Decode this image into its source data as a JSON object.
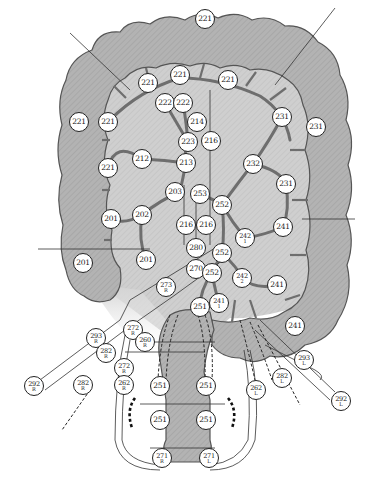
{
  "diagram": {
    "colors": {
      "colon_fill": "#b5b5b5",
      "colon_stroke": "#555555",
      "mesentery_fill": "#d6d6d6",
      "vessel": "#6e6e6e",
      "node_fill": "#ffffff",
      "node_stroke": "#222222",
      "line": "#333333"
    },
    "nodes": [
      {
        "id": "n1",
        "label": "221",
        "sub": "",
        "x": 205,
        "y": 19
      },
      {
        "id": "n2",
        "label": "221",
        "sub": "",
        "x": 148,
        "y": 83
      },
      {
        "id": "n3",
        "label": "221",
        "sub": "",
        "x": 180,
        "y": 75
      },
      {
        "id": "n4",
        "label": "221",
        "sub": "",
        "x": 228,
        "y": 80
      },
      {
        "id": "n5",
        "label": "222",
        "sub": "",
        "x": 165,
        "y": 103
      },
      {
        "id": "n6",
        "label": "222",
        "sub": "",
        "x": 183,
        "y": 103
      },
      {
        "id": "n7",
        "label": "214",
        "sub": "",
        "x": 197,
        "y": 122
      },
      {
        "id": "n8",
        "label": "216",
        "sub": "",
        "x": 211,
        "y": 141
      },
      {
        "id": "n9",
        "label": "223",
        "sub": "",
        "x": 188,
        "y": 142
      },
      {
        "id": "n10",
        "label": "221",
        "sub": "",
        "x": 79,
        "y": 122
      },
      {
        "id": "n11",
        "label": "221",
        "sub": "",
        "x": 108,
        "y": 122
      },
      {
        "id": "n12",
        "label": "231",
        "sub": "",
        "x": 282,
        "y": 117
      },
      {
        "id": "n13",
        "label": "231",
        "sub": "",
        "x": 316,
        "y": 127
      },
      {
        "id": "n14",
        "label": "212",
        "sub": "",
        "x": 142,
        "y": 159
      },
      {
        "id": "n15",
        "label": "213",
        "sub": "",
        "x": 186,
        "y": 163
      },
      {
        "id": "n16",
        "label": "232",
        "sub": "",
        "x": 253,
        "y": 164
      },
      {
        "id": "n17",
        "label": "221",
        "sub": "",
        "x": 108,
        "y": 168
      },
      {
        "id": "n18",
        "label": "231",
        "sub": "",
        "x": 286,
        "y": 184
      },
      {
        "id": "n19",
        "label": "203",
        "sub": "",
        "x": 175,
        "y": 192
      },
      {
        "id": "n20",
        "label": "253",
        "sub": "",
        "x": 200,
        "y": 194
      },
      {
        "id": "n21",
        "label": "252",
        "sub": "",
        "x": 222,
        "y": 205
      },
      {
        "id": "n22",
        "label": "201",
        "sub": "",
        "x": 111,
        "y": 219
      },
      {
        "id": "n23",
        "label": "202",
        "sub": "",
        "x": 142,
        "y": 215
      },
      {
        "id": "n24",
        "label": "216",
        "sub": "",
        "x": 186,
        "y": 225
      },
      {
        "id": "n25",
        "label": "216",
        "sub": "",
        "x": 206,
        "y": 225
      },
      {
        "id": "n26",
        "label": "241",
        "sub": "",
        "x": 283,
        "y": 227
      },
      {
        "id": "n27",
        "label": "242",
        "sub": "1",
        "x": 245,
        "y": 238
      },
      {
        "id": "n28",
        "label": "280",
        "sub": "",
        "x": 196,
        "y": 248
      },
      {
        "id": "n29",
        "label": "252",
        "sub": "",
        "x": 222,
        "y": 253
      },
      {
        "id": "n30",
        "label": "201",
        "sub": "",
        "x": 83,
        "y": 263
      },
      {
        "id": "n31",
        "label": "201",
        "sub": "",
        "x": 146,
        "y": 260
      },
      {
        "id": "n32",
        "label": "270",
        "sub": "",
        "x": 196,
        "y": 269
      },
      {
        "id": "n33",
        "label": "252",
        "sub": "",
        "x": 212,
        "y": 273
      },
      {
        "id": "n34",
        "label": "242",
        "sub": "2",
        "x": 242,
        "y": 278
      },
      {
        "id": "n35",
        "label": "241",
        "sub": "",
        "x": 277,
        "y": 285
      },
      {
        "id": "n36",
        "label": "273",
        "sub": "R",
        "x": 166,
        "y": 287
      },
      {
        "id": "n37",
        "label": "241",
        "sub": "1",
        "x": 219,
        "y": 303
      },
      {
        "id": "n38",
        "label": "251",
        "sub": "",
        "x": 200,
        "y": 307
      },
      {
        "id": "n39",
        "label": "241",
        "sub": "",
        "x": 295,
        "y": 326
      },
      {
        "id": "n40",
        "label": "272",
        "sub": "R",
        "x": 133,
        "y": 330
      },
      {
        "id": "n41",
        "label": "293",
        "sub": "R",
        "x": 96,
        "y": 338
      },
      {
        "id": "n42",
        "label": "260",
        "sub": "R",
        "x": 145,
        "y": 342
      },
      {
        "id": "n43",
        "label": "282",
        "sub": "R",
        "x": 106,
        "y": 353
      },
      {
        "id": "n44",
        "label": "293",
        "sub": "L",
        "x": 304,
        "y": 360
      },
      {
        "id": "n45",
        "label": "272",
        "sub": "R",
        "x": 124,
        "y": 368
      },
      {
        "id": "n46",
        "label": "282",
        "sub": "L",
        "x": 282,
        "y": 378
      },
      {
        "id": "n47",
        "label": "262",
        "sub": "R",
        "x": 124,
        "y": 385
      },
      {
        "id": "n48",
        "label": "292",
        "sub": "R",
        "x": 34,
        "y": 386
      },
      {
        "id": "n49",
        "label": "282",
        "sub": "R",
        "x": 83,
        "y": 385
      },
      {
        "id": "n50",
        "label": "251",
        "sub": "",
        "x": 160,
        "y": 386
      },
      {
        "id": "n51",
        "label": "251",
        "sub": "",
        "x": 206,
        "y": 386
      },
      {
        "id": "n52",
        "label": "262",
        "sub": "L",
        "x": 256,
        "y": 390
      },
      {
        "id": "n53",
        "label": "292",
        "sub": "L",
        "x": 341,
        "y": 401
      },
      {
        "id": "n54",
        "label": "251",
        "sub": "",
        "x": 160,
        "y": 420
      },
      {
        "id": "n55",
        "label": "251",
        "sub": "",
        "x": 206,
        "y": 420
      },
      {
        "id": "n56",
        "label": "271",
        "sub": "R",
        "x": 162,
        "y": 458
      },
      {
        "id": "n57",
        "label": "271",
        "sub": "L",
        "x": 209,
        "y": 458
      }
    ]
  }
}
